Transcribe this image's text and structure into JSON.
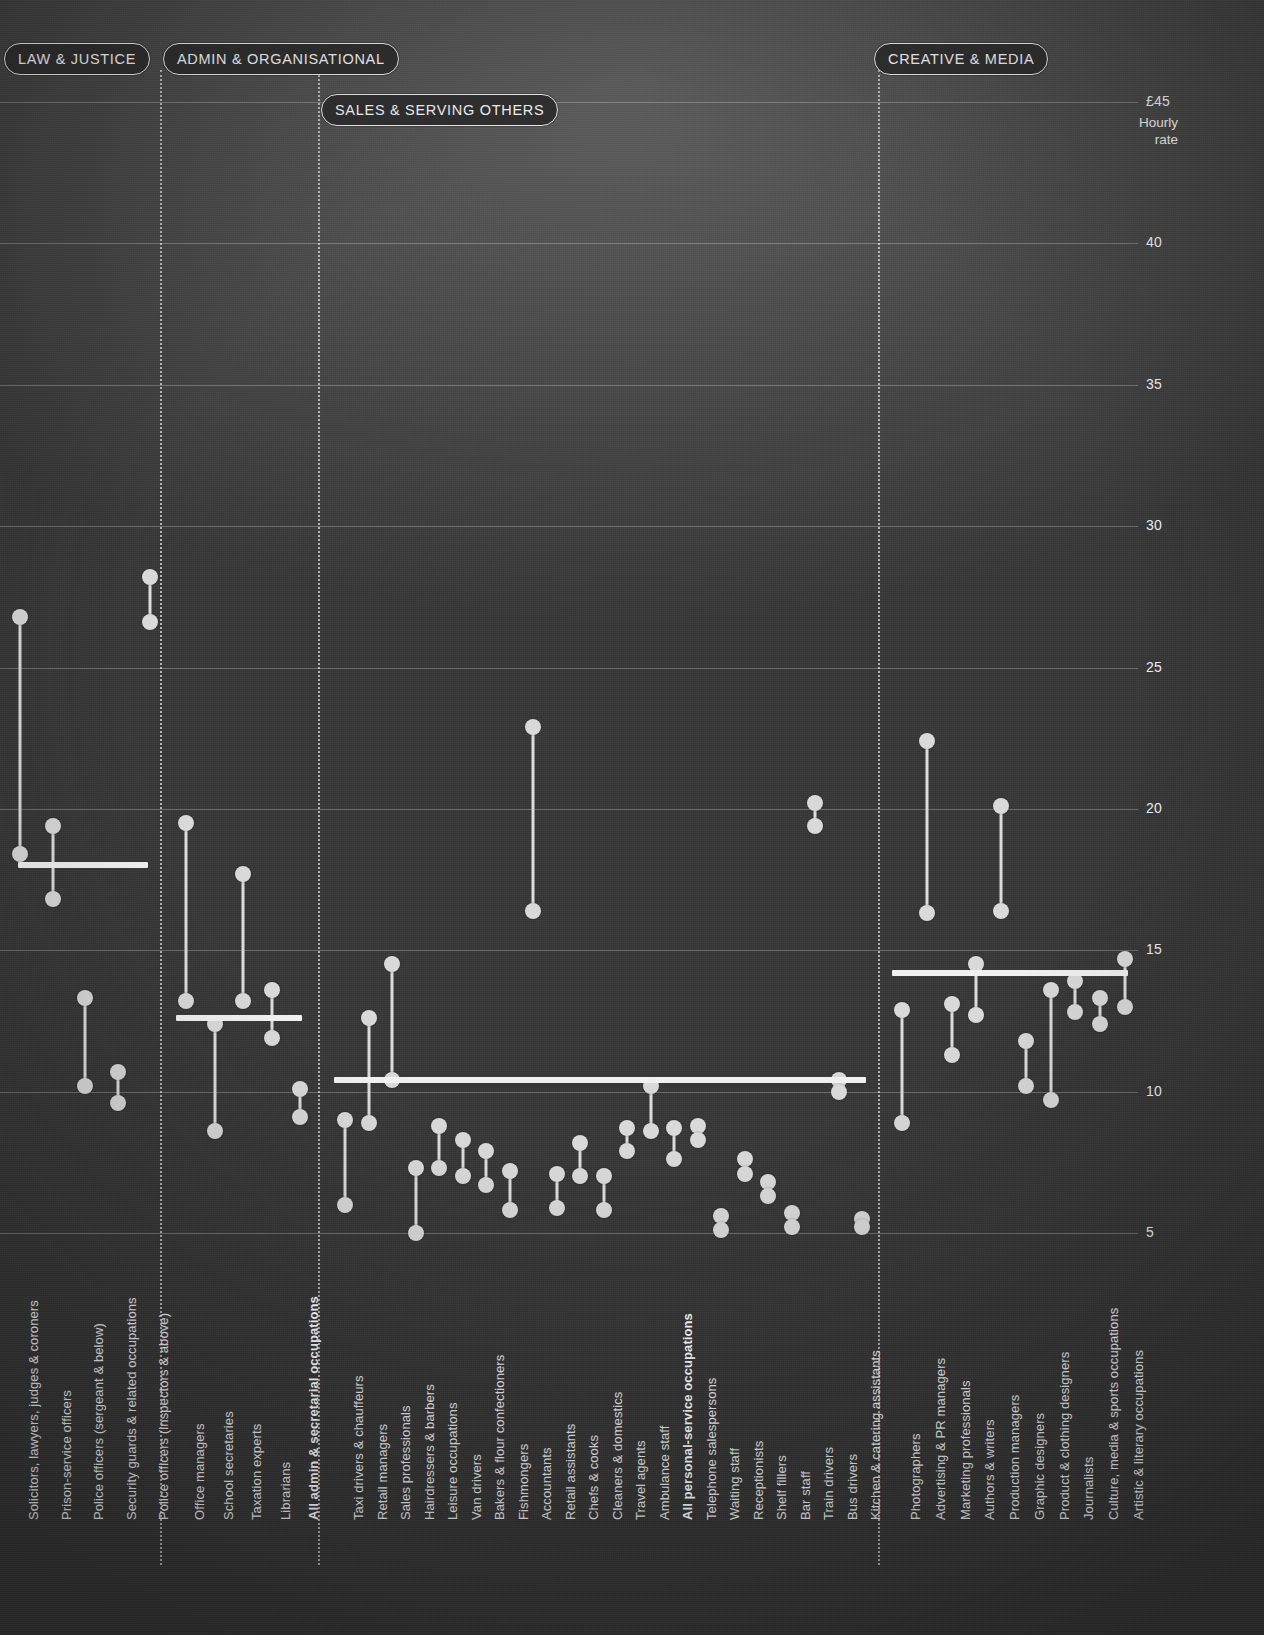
{
  "axis": {
    "top_label": "£45",
    "caption": "Hourly\nrate",
    "ticks": [
      {
        "value": 45,
        "label": "£45"
      },
      {
        "value": 40,
        "label": "40"
      },
      {
        "value": 35,
        "label": "35"
      },
      {
        "value": 30,
        "label": "30"
      },
      {
        "value": 25,
        "label": "25"
      },
      {
        "value": 20,
        "label": "20"
      },
      {
        "value": 15,
        "label": "15"
      },
      {
        "value": 10,
        "label": "10"
      },
      {
        "value": 5,
        "label": "5"
      }
    ]
  },
  "groups": [
    {
      "id": "law",
      "label": "LAW & JUSTICE"
    },
    {
      "id": "admin",
      "label": "ADMIN & ORGANISATIONAL"
    },
    {
      "id": "sales",
      "label": "SALES & SERVING OTHERS"
    },
    {
      "id": "creative",
      "label": "CREATIVE & MEDIA"
    }
  ],
  "colors": {
    "background": "#3f3f3f",
    "mark": "#d9d9d9",
    "average_line": "#f0f0f0",
    "gridline": "rgba(255,255,255,0.26)",
    "text": "#ededed"
  },
  "chart_data": {
    "type": "scatter",
    "title": "",
    "xlabel": "",
    "ylabel": "Hourly rate",
    "ylim": [
      5,
      45
    ],
    "yticks": [
      5,
      10,
      15,
      20,
      25,
      30,
      35,
      40,
      45
    ],
    "grid": true,
    "legend": "none",
    "series_note": "Each occupation is a dumbbell: upper dot = men's hourly rate, lower dot = women's hourly rate. Thick horizontal rule per group = group average.",
    "group_averages": [
      {
        "group": "LAW & JUSTICE",
        "value": 18.0
      },
      {
        "group": "ADMIN & ORGANISATIONAL",
        "value": 12.6
      },
      {
        "group": "SALES & SERVING OTHERS",
        "value": 10.4
      },
      {
        "group": "CREATIVE & MEDIA",
        "value": 14.2
      }
    ],
    "points": [
      {
        "group": "LAW & JUSTICE",
        "label": "Solicitors, lawyers, judges & coroners",
        "high": 26.8,
        "low": 18.4,
        "bold": false
      },
      {
        "group": "LAW & JUSTICE",
        "label": "Prison-service officers",
        "high": 19.4,
        "low": 16.8,
        "bold": false
      },
      {
        "group": "LAW & JUSTICE",
        "label": "Police officers (sergeant & below)",
        "high": 13.3,
        "low": 10.2,
        "bold": false
      },
      {
        "group": "LAW & JUSTICE",
        "label": "Security guards & related occupations",
        "high": 10.7,
        "low": 9.6,
        "bold": false
      },
      {
        "group": "LAW & JUSTICE",
        "label": "Police officers (inspectors & above)",
        "high": 28.2,
        "low": 26.6,
        "bold": false
      },
      {
        "group": "ADMIN & ORGANISATIONAL",
        "label": "Office managers",
        "high": 19.5,
        "low": 13.2,
        "bold": false
      },
      {
        "group": "ADMIN & ORGANISATIONAL",
        "label": "School secretaries",
        "high": 12.4,
        "low": 8.6,
        "bold": false
      },
      {
        "group": "ADMIN & ORGANISATIONAL",
        "label": "Taxation experts",
        "high": 17.7,
        "low": 13.2,
        "bold": false
      },
      {
        "group": "ADMIN & ORGANISATIONAL",
        "label": "Librarians",
        "high": 13.6,
        "low": 11.9,
        "bold": false
      },
      {
        "group": "ADMIN & ORGANISATIONAL",
        "label": "All admin & secretarial occupations",
        "high": 10.1,
        "low": 9.1,
        "bold": true
      },
      {
        "group": "SALES & SERVING OTHERS",
        "label": "Taxi drivers & chauffeurs",
        "high": 9.0,
        "low": 6.0,
        "bold": false
      },
      {
        "group": "SALES & SERVING OTHERS",
        "label": "Retail managers",
        "high": 12.6,
        "low": 8.9,
        "bold": false
      },
      {
        "group": "SALES & SERVING OTHERS",
        "label": "Sales professionals",
        "high": 14.5,
        "low": 10.4,
        "bold": false
      },
      {
        "group": "SALES & SERVING OTHERS",
        "label": "Hairdressers & barbers",
        "high": 7.3,
        "low": 5.0,
        "bold": false
      },
      {
        "group": "SALES & SERVING OTHERS",
        "label": "Leisure occupations",
        "high": 8.8,
        "low": 7.3,
        "bold": false
      },
      {
        "group": "SALES & SERVING OTHERS",
        "label": "Van drivers",
        "high": 8.3,
        "low": 7.0,
        "bold": false
      },
      {
        "group": "SALES & SERVING OTHERS",
        "label": "Bakers & flour confectioners",
        "high": 7.9,
        "low": 6.7,
        "bold": false
      },
      {
        "group": "SALES & SERVING OTHERS",
        "label": "Fishmongers",
        "high": 7.2,
        "low": 5.8,
        "bold": false
      },
      {
        "group": "SALES & SERVING OTHERS",
        "label": "Accountants",
        "high": 22.9,
        "low": 16.4,
        "bold": false
      },
      {
        "group": "SALES & SERVING OTHERS",
        "label": "Retail assistants",
        "high": 7.1,
        "low": 5.9,
        "bold": false
      },
      {
        "group": "SALES & SERVING OTHERS",
        "label": "Chefs & cooks",
        "high": 8.2,
        "low": 7.0,
        "bold": false
      },
      {
        "group": "SALES & SERVING OTHERS",
        "label": "Cleaners & domestics",
        "high": 7.0,
        "low": 5.8,
        "bold": false
      },
      {
        "group": "SALES & SERVING OTHERS",
        "label": "Travel agents",
        "high": 8.7,
        "low": 7.9,
        "bold": false
      },
      {
        "group": "SALES & SERVING OTHERS",
        "label": "Ambulance staff",
        "high": 10.2,
        "low": 8.6,
        "bold": false
      },
      {
        "group": "SALES & SERVING OTHERS",
        "label": "All personal-service occupations",
        "high": 8.7,
        "low": 7.6,
        "bold": true
      },
      {
        "group": "SALES & SERVING OTHERS",
        "label": "Telephone salespersons",
        "high": 8.8,
        "low": 8.3,
        "bold": false
      },
      {
        "group": "SALES & SERVING OTHERS",
        "label": "Waiting staff",
        "high": 5.6,
        "low": 5.1,
        "bold": false
      },
      {
        "group": "SALES & SERVING OTHERS",
        "label": "Receptionists",
        "high": 7.6,
        "low": 7.1,
        "bold": false
      },
      {
        "group": "SALES & SERVING OTHERS",
        "label": "Shelf fillers",
        "high": 6.8,
        "low": 6.3,
        "bold": false
      },
      {
        "group": "SALES & SERVING OTHERS",
        "label": "Bar staff",
        "high": 5.7,
        "low": 5.2,
        "bold": false
      },
      {
        "group": "SALES & SERVING OTHERS",
        "label": "Train drivers",
        "high": 20.2,
        "low": 19.4,
        "bold": false
      },
      {
        "group": "SALES & SERVING OTHERS",
        "label": "Bus drivers",
        "high": 10.4,
        "low": 10.0,
        "bold": false
      },
      {
        "group": "SALES & SERVING OTHERS",
        "label": "Kitchen & catering assistants",
        "high": 5.5,
        "low": 5.2,
        "bold": false
      },
      {
        "group": "CREATIVE & MEDIA",
        "label": "Photographers",
        "high": 12.9,
        "low": 8.9,
        "bold": false
      },
      {
        "group": "CREATIVE & MEDIA",
        "label": "Advertising & PR managers",
        "high": 22.4,
        "low": 16.3,
        "bold": false
      },
      {
        "group": "CREATIVE & MEDIA",
        "label": "Marketing professionals",
        "high": 13.1,
        "low": 11.3,
        "bold": false
      },
      {
        "group": "CREATIVE & MEDIA",
        "label": "Authors & writers",
        "high": 14.5,
        "low": 12.7,
        "bold": false
      },
      {
        "group": "CREATIVE & MEDIA",
        "label": "Production managers",
        "high": 20.1,
        "low": 16.4,
        "bold": false
      },
      {
        "group": "CREATIVE & MEDIA",
        "label": "Graphic designers",
        "high": 11.8,
        "low": 10.2,
        "bold": false
      },
      {
        "group": "CREATIVE & MEDIA",
        "label": "Product & clothing designers",
        "high": 13.6,
        "low": 9.7,
        "bold": false
      },
      {
        "group": "CREATIVE & MEDIA",
        "label": "Journalists",
        "high": 13.9,
        "low": 12.8,
        "bold": false
      },
      {
        "group": "CREATIVE & MEDIA",
        "label": "Culture, media & sports occupations",
        "high": 13.3,
        "low": 12.4,
        "bold": false
      },
      {
        "group": "CREATIVE & MEDIA",
        "label": "Artistic & literary occupations",
        "high": 14.7,
        "low": 13.0,
        "bold": false
      }
    ]
  }
}
